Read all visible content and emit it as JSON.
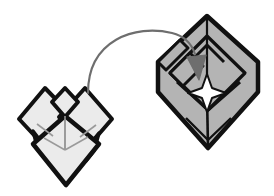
{
  "figure": {
    "background_color": "#ffffff",
    "outline_color": "#111111",
    "crease_color": "#8a8a8a",
    "arrow_color": "#6e6e6e"
  },
  "left_model": {
    "label": "before-fold-model",
    "fill_color": "#ebebeb",
    "shade_color": "#dcdcdc",
    "description": "Light gray folded paper form with two outward diamond wings, a small center peak, and a large bottom diamond flap"
  },
  "right_model": {
    "label": "after-fold-model",
    "fill_color": "#b4b4b4",
    "shade_color": "#a8a8a8",
    "description": "Medium gray folded paper form, a large diamond body with an inner tilted square panel and a four-pointed star crease at center"
  },
  "arrow": {
    "label": "fold-motion-arrow",
    "color": "#6e6e6e",
    "stroke_width": 2,
    "head_fill": "#6e6e6e",
    "direction": "left-to-right curved arc"
  },
  "star": {
    "label": "center-star-crease",
    "points": 4,
    "fill_color": "#ffffff",
    "stroke_color": "#111111"
  }
}
